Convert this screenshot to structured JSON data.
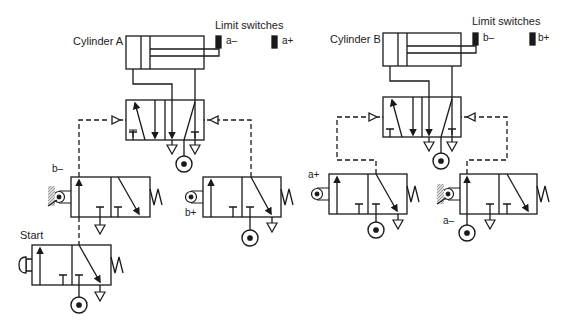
{
  "circuit_a": {
    "cylinder_label": "Cylinder A",
    "limit_switches_label": "Limit switches",
    "switch_minus": "a–",
    "switch_plus": "a+",
    "valve_b_minus_label": "b–",
    "valve_b_plus_label": "b+",
    "start_label": "Start"
  },
  "circuit_b": {
    "cylinder_label": "Cylinder B",
    "limit_switches_label": "Limit switches",
    "switch_minus": "b–",
    "switch_plus": "b+",
    "valve_a_plus_label": "a+",
    "valve_a_minus_label": "a–"
  },
  "colors": {
    "line": "#1a1a1a",
    "hatch": "#999999"
  }
}
